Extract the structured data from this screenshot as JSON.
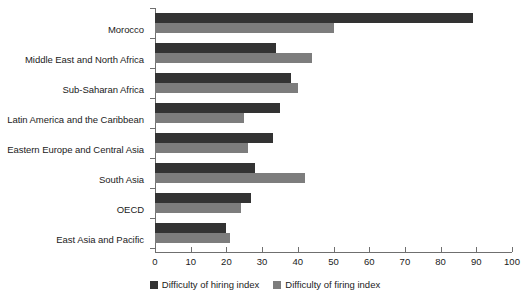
{
  "chart_data": {
    "type": "bar",
    "orientation": "horizontal",
    "title": "",
    "xlabel": "",
    "ylabel": "",
    "xlim": [
      0,
      100
    ],
    "xticks": [
      0,
      10,
      20,
      30,
      40,
      50,
      60,
      70,
      80,
      90,
      100
    ],
    "grid": false,
    "legend_position": "bottom-center",
    "categories": [
      "Morocco",
      "Middle East and North Africa",
      "Sub-Saharan Africa",
      "Latin America and the Caribbean",
      "Eastern Europe and Central Asia",
      "South Asia",
      "OECD",
      "East Asia and Pacific"
    ],
    "series": [
      {
        "name": "Difficulty of hiring index",
        "color": "#333333",
        "values": [
          89,
          34,
          38,
          35,
          33,
          28,
          27,
          20
        ]
      },
      {
        "name": "Difficulty of firing index",
        "color": "#7d7d7d",
        "values": [
          50,
          44,
          40,
          25,
          26,
          42,
          24,
          21
        ]
      }
    ]
  },
  "legend": {
    "items": [
      {
        "label": "Difficulty of hiring index",
        "swatch": "hiring"
      },
      {
        "label": "Difficulty of firing index",
        "swatch": "firing"
      }
    ]
  }
}
